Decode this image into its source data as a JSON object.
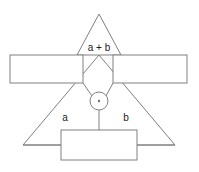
{
  "diagram": {
    "type": "vector-line-diagram",
    "canvas": {
      "width": 199,
      "height": 172
    },
    "colors": {
      "background": "#ffffff",
      "stroke": "#808080",
      "shape_fill": "#ffffff",
      "text": "#1a1a1a",
      "dot": "#707070"
    },
    "labels": {
      "sum": "a + b",
      "left_term": "a",
      "right_term": "b"
    },
    "shapes": {
      "upper_triangle": {
        "name": "upper-triangle",
        "points": "99,14 77,55 121,55"
      },
      "lower_triangle": {
        "name": "lower-triangle",
        "points": "99,55 23,145 175,145"
      },
      "left_rectangle": {
        "name": "left-rectangle",
        "x": 10,
        "y": 55,
        "width": 73,
        "height": 28
      },
      "right_rectangle": {
        "name": "right-rectangle",
        "x": 113,
        "y": 55,
        "width": 74,
        "height": 28
      },
      "bottom_rectangle": {
        "name": "bottom-rectangle",
        "x": 61,
        "y": 130,
        "width": 76,
        "height": 30
      },
      "operator_node": {
        "name": "operator-node",
        "cx": 99,
        "cy": 101,
        "r": 9,
        "dot_r": 1.2
      }
    },
    "connectors": [
      {
        "name": "left-rect-to-node",
        "x1": 83,
        "y1": 83,
        "x2": 92,
        "y2": 96
      },
      {
        "name": "right-rect-to-node",
        "x1": 113,
        "y1": 83,
        "x2": 106,
        "y2": 96
      },
      {
        "name": "node-to-bottom-rect",
        "x1": 99,
        "y1": 110,
        "x2": 99,
        "y2": 130
      },
      {
        "name": "left-vertex-to-bottom-rect",
        "x1": 23,
        "y1": 145,
        "x2": 61,
        "y2": 145
      },
      {
        "name": "right-vertex-to-bottom-rect",
        "x1": 137,
        "y1": 145,
        "x2": 175,
        "y2": 145
      }
    ],
    "text_positions": {
      "sum": {
        "x": 99,
        "y": 48
      },
      "left_term": {
        "x": 65,
        "y": 118
      },
      "right_term": {
        "x": 126,
        "y": 118
      }
    }
  }
}
